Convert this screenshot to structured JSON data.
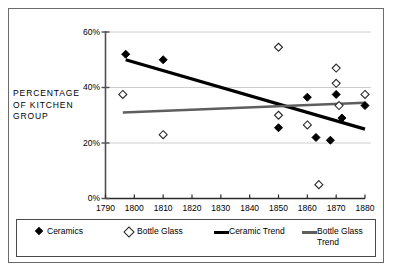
{
  "chart_data": {
    "type": "scatter",
    "title": "",
    "xlabel": "",
    "ylabel": "PERCENTAGE OF KITCHEN GROUP",
    "ylabel_lines": [
      "PERCENTAGE",
      "OF  KITCHEN",
      "GROUP"
    ],
    "xlim": [
      1790,
      1880
    ],
    "ylim": [
      0,
      60
    ],
    "xticks": [
      1790,
      1800,
      1810,
      1820,
      1830,
      1840,
      1850,
      1860,
      1870,
      1880
    ],
    "xtick_labels": [
      "1790",
      "1800",
      "1810",
      "1820",
      "1830",
      "1840",
      "1850",
      "1860",
      "1870",
      "1880"
    ],
    "yticks": [
      0,
      20,
      40,
      60
    ],
    "ytick_labels": [
      "0%",
      "20%",
      "40%",
      "60%"
    ],
    "grid": "horizontal",
    "legend_position": "below-axes",
    "series": [
      {
        "name": "Ceramics",
        "marker": "filled-diamond",
        "color": "#000000",
        "points": [
          {
            "x": 1797,
            "y": 52.0
          },
          {
            "x": 1810,
            "y": 50.0
          },
          {
            "x": 1850,
            "y": 25.5
          },
          {
            "x": 1860,
            "y": 36.5
          },
          {
            "x": 1863,
            "y": 22.0
          },
          {
            "x": 1868,
            "y": 21.0
          },
          {
            "x": 1870,
            "y": 37.5
          },
          {
            "x": 1872,
            "y": 29.0
          },
          {
            "x": 1880,
            "y": 33.5
          }
        ]
      },
      {
        "name": "Bottle Glass",
        "marker": "open-diamond",
        "color": "#ffffff",
        "points": [
          {
            "x": 1796,
            "y": 37.5
          },
          {
            "x": 1810,
            "y": 23.0
          },
          {
            "x": 1850,
            "y": 54.5
          },
          {
            "x": 1850,
            "y": 30.0
          },
          {
            "x": 1860,
            "y": 26.5
          },
          {
            "x": 1864,
            "y": 5.0
          },
          {
            "x": 1870,
            "y": 47.0
          },
          {
            "x": 1870,
            "y": 41.5
          },
          {
            "x": 1871,
            "y": 33.5
          },
          {
            "x": 1880,
            "y": 37.5
          }
        ]
      }
    ],
    "trends": [
      {
        "name": "Ceramic Trend",
        "color": "#000000",
        "width": 3.2,
        "x0": 1797,
        "y0": 50.0,
        "x1": 1880,
        "y1": 25.0
      },
      {
        "name": "Bottle Glass Trend",
        "color": "#5e5e5e",
        "width": 2.4,
        "x0": 1796,
        "y0": 31.0,
        "x1": 1880,
        "y1": 34.5
      }
    ]
  },
  "legend": {
    "items": [
      {
        "label": "Ceramics",
        "mark": "filled-diamond"
      },
      {
        "label": "Bottle Glass",
        "mark": "open-diamond"
      },
      {
        "label": "Ceramic Trend",
        "mark": "thick-line"
      },
      {
        "label": "Bottle Glass",
        "label2": "Trend",
        "mark": "thin-line"
      }
    ]
  }
}
